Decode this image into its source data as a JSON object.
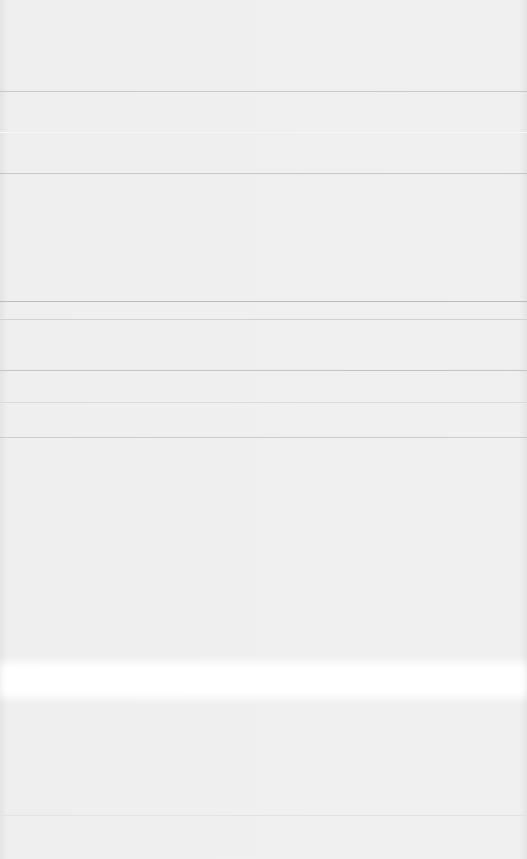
{
  "screen": {
    "width": 527,
    "height": 859,
    "background": "#ececec",
    "content_legible": false
  },
  "rules": [
    {
      "y": 91,
      "color": "#c9c9c9"
    },
    {
      "y": 132,
      "color": "#f7f7f7"
    },
    {
      "y": 173,
      "color": "#c6c6c6"
    },
    {
      "y": 301,
      "color": "#bdbdbd"
    },
    {
      "y": 319,
      "color": "#d2d2d2"
    },
    {
      "y": 370,
      "color": "#c4c4c4"
    },
    {
      "y": 402,
      "color": "#dadada"
    },
    {
      "y": 437,
      "color": "#cdcdcd"
    },
    {
      "y": 815,
      "color": "#e2e2e2"
    }
  ],
  "bands": [
    {
      "y": 662,
      "height": 36,
      "color": "#ffffff"
    }
  ]
}
